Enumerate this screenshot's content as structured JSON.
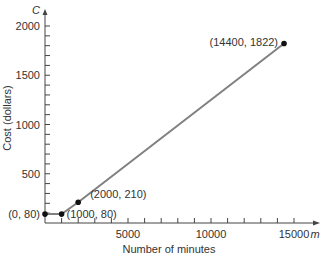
{
  "chart_data": {
    "type": "line",
    "title": "",
    "xlabel": "Number of minutes",
    "ylabel": "Cost (dollars)",
    "x_var": "m",
    "y_var": "C",
    "xlim": [
      0,
      15000
    ],
    "ylim": [
      0,
      2000
    ],
    "x_ticks": [
      5000,
      10000,
      15000
    ],
    "x_tick_labels": [
      "5000",
      "10000",
      "15000"
    ],
    "x_minor_step": 1000,
    "y_ticks": [
      500,
      1000,
      1500,
      2000
    ],
    "y_tick_labels": [
      "500",
      "1000",
      "1500",
      "2000"
    ],
    "y_minor_step": 100,
    "grid": false,
    "legend": null,
    "series": [
      {
        "name": "Cost",
        "color": "#808080",
        "x": [
          0,
          1000,
          2000,
          14400
        ],
        "y": [
          80,
          80,
          210,
          1822
        ]
      }
    ],
    "points": [
      {
        "x": 0,
        "y": 80,
        "label": "(0, 80)"
      },
      {
        "x": 1000,
        "y": 80,
        "label": "(1000, 80)"
      },
      {
        "x": 2000,
        "y": 210,
        "label": "(2000, 210)"
      },
      {
        "x": 14400,
        "y": 1822,
        "label": "(14400, 1822)"
      }
    ],
    "colors": {
      "line": "#808080",
      "axis": "#444444",
      "point": "#111111",
      "text": "#333333"
    }
  }
}
